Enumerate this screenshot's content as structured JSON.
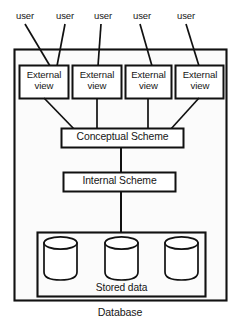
{
  "diagram": {
    "title_below_frame": "Database",
    "users": [
      {
        "label": "user"
      },
      {
        "label": "user"
      },
      {
        "label": "user"
      },
      {
        "label": "user"
      },
      {
        "label": "user"
      }
    ],
    "external_views": [
      {
        "line1": "External",
        "line2": "view"
      },
      {
        "line1": "External",
        "line2": "view"
      },
      {
        "line1": "External",
        "line2": "view"
      },
      {
        "line1": "External",
        "line2": "view"
      }
    ],
    "conceptual_scheme": {
      "label": "Conceptual Scheme"
    },
    "internal_scheme": {
      "label": "Internal Scheme"
    },
    "stored_data": {
      "label": "Stored data",
      "cylinders": [
        {
          "name": "database-cylinder"
        },
        {
          "name": "database-cylinder"
        },
        {
          "name": "database-cylinder"
        }
      ]
    },
    "colors": {
      "stroke": "#111111",
      "frame_fill": "#fbfbfb",
      "box_fill": "#ffffff",
      "page_bg": "#ffffff",
      "text": "#161616"
    }
  }
}
